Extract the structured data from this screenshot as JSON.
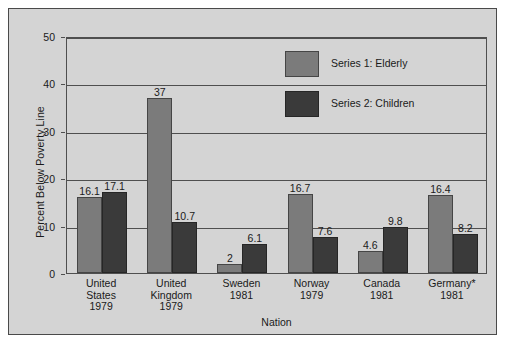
{
  "chart_data": {
    "type": "bar",
    "title": "",
    "xlabel": "Nation",
    "ylabel": "Percent Below Poverty Line",
    "ylim": [
      0,
      50
    ],
    "yticks": [
      0,
      10,
      20,
      30,
      40,
      50
    ],
    "grid": true,
    "legend_position": "top-center",
    "categories": [
      "United\nStates\n1979",
      "United\nKingdom\n1979",
      "Sweden\n1981",
      "Norway\n1979",
      "Canada\n1981",
      "Germany*\n1981"
    ],
    "category_lines": [
      [
        "United",
        "States",
        "1979"
      ],
      [
        "United",
        "Kingdom",
        "1979"
      ],
      [
        "Sweden",
        "1981",
        ""
      ],
      [
        "Norway",
        "1979",
        ""
      ],
      [
        "Canada",
        "1981",
        ""
      ],
      [
        "Germany*",
        "1981",
        ""
      ]
    ],
    "series": [
      {
        "name": "Series 1: Elderly",
        "color": "#7b7b7b",
        "values": [
          16.1,
          37,
          2,
          16.7,
          4.6,
          16.4
        ],
        "labels": [
          "16.1",
          "37",
          "2",
          "16.7",
          "4.6",
          "16.4"
        ]
      },
      {
        "name": "Series 2: Children",
        "color": "#3a3a3a",
        "values": [
          17.1,
          10.7,
          6.1,
          7.6,
          9.8,
          8.2
        ],
        "labels": [
          "17.1",
          "10.7",
          "6.1",
          "7.6",
          "9.8",
          "8.2"
        ]
      }
    ]
  },
  "axis": {
    "y_tick_labels": [
      "0",
      "10",
      "20",
      "30",
      "40",
      "50"
    ],
    "y_title": "Percent Below Poverty Line",
    "x_title": "Nation"
  },
  "legend": {
    "entries": [
      {
        "label": "Series 1: Elderly",
        "color": "#7b7b7b"
      },
      {
        "label": "Series 2: Children",
        "color": "#3a3a3a"
      }
    ]
  },
  "colors": {
    "page_background": "#ffffff",
    "panel_background": "#d4d4d4",
    "frame": "#4a4a4a",
    "axis": "#4f4f4f",
    "series1": "#7b7b7b",
    "series2": "#3a3a3a",
    "text": "#1a1a1a"
  }
}
